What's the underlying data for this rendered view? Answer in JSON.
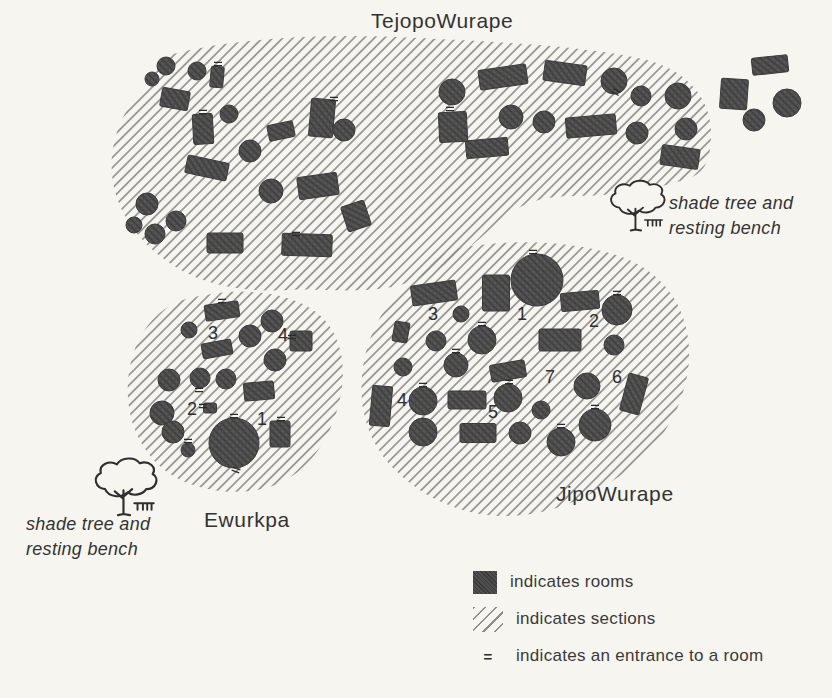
{
  "colors": {
    "paper": "#f6f5f0",
    "ink": "#333333",
    "room_fill": "#4f4f4f",
    "hatch_line": "#8d8d8d"
  },
  "legend": {
    "rooms_label": "indicates rooms",
    "sections_label": "indicates sections",
    "entrance_symbol": "=",
    "entrance_label": "indicates an entrance to a room"
  },
  "trees": [
    {
      "x": 606,
      "y": 182,
      "s": 0.95,
      "label": "shade tree and\nresting bench"
    },
    {
      "x": 90,
      "y": 460,
      "s": 1.08,
      "label": "shade tree and\nresting bench"
    }
  ],
  "diagram": {
    "compounds": [
      {
        "name": "TejopoWurape",
        "outline": "M173 54 C240 37 330 33 420 38 C495 42 575 45 638 58 C688 68 713 100 711 138 C710 162 704 172 690 178 C655 190 610 196 575 196 C548 196 530 200 512 212 C492 226 480 240 463 252 C445 266 420 281 392 287 C355 294 320 288 290 290 C258 292 222 289 193 276 C152 258 120 222 113 183 C107 146 121 112 142 90 C153 77 160 60 173 54 Z",
        "rooms": [
          {
            "t": "c",
            "x": 166,
            "y": 66,
            "r": 9
          },
          {
            "t": "c",
            "x": 152,
            "y": 79,
            "r": 7
          },
          {
            "t": "c",
            "x": 197,
            "y": 71,
            "r": 9
          },
          {
            "t": "r",
            "x": 217,
            "y": 77,
            "w": 13,
            "h": 21,
            "a": 5
          },
          {
            "t": "r",
            "x": 175,
            "y": 99,
            "w": 28,
            "h": 19,
            "a": 10
          },
          {
            "t": "r",
            "x": 203,
            "y": 129,
            "w": 20,
            "h": 30,
            "a": -3
          },
          {
            "t": "c",
            "x": 229,
            "y": 114,
            "r": 9
          },
          {
            "t": "r",
            "x": 281,
            "y": 131,
            "w": 26,
            "h": 16,
            "a": -12
          },
          {
            "t": "r",
            "x": 322,
            "y": 118,
            "w": 24,
            "h": 38,
            "a": 5
          },
          {
            "t": "c",
            "x": 344,
            "y": 130,
            "r": 11
          },
          {
            "t": "r",
            "x": 207,
            "y": 168,
            "w": 42,
            "h": 18,
            "a": 12
          },
          {
            "t": "c",
            "x": 250,
            "y": 151,
            "r": 11
          },
          {
            "t": "r",
            "x": 318,
            "y": 186,
            "w": 40,
            "h": 22,
            "a": -8
          },
          {
            "t": "c",
            "x": 271,
            "y": 191,
            "r": 12
          },
          {
            "t": "r",
            "x": 356,
            "y": 216,
            "w": 24,
            "h": 26,
            "a": -18
          },
          {
            "t": "c",
            "x": 147,
            "y": 204,
            "r": 11
          },
          {
            "t": "c",
            "x": 176,
            "y": 221,
            "r": 10
          },
          {
            "t": "c",
            "x": 155,
            "y": 234,
            "r": 10
          },
          {
            "t": "c",
            "x": 134,
            "y": 225,
            "r": 8
          },
          {
            "t": "r",
            "x": 225,
            "y": 243,
            "w": 36,
            "h": 20,
            "a": 0
          },
          {
            "t": "r",
            "x": 307,
            "y": 245,
            "w": 50,
            "h": 22,
            "a": 2
          },
          {
            "t": "c",
            "x": 452,
            "y": 92,
            "r": 13
          },
          {
            "t": "r",
            "x": 503,
            "y": 77,
            "w": 48,
            "h": 20,
            "a": -8
          },
          {
            "t": "r",
            "x": 565,
            "y": 73,
            "w": 42,
            "h": 20,
            "a": 8
          },
          {
            "t": "c",
            "x": 614,
            "y": 81,
            "r": 13
          },
          {
            "t": "c",
            "x": 641,
            "y": 96,
            "r": 10
          },
          {
            "t": "c",
            "x": 678,
            "y": 96,
            "r": 13
          },
          {
            "t": "r",
            "x": 453,
            "y": 127,
            "w": 28,
            "h": 30,
            "a": -3
          },
          {
            "t": "c",
            "x": 511,
            "y": 117,
            "r": 12
          },
          {
            "t": "c",
            "x": 544,
            "y": 122,
            "r": 11
          },
          {
            "t": "r",
            "x": 591,
            "y": 126,
            "w": 50,
            "h": 20,
            "a": -5
          },
          {
            "t": "c",
            "x": 637,
            "y": 133,
            "r": 11
          },
          {
            "t": "c",
            "x": 686,
            "y": 129,
            "r": 11
          },
          {
            "t": "r",
            "x": 487,
            "y": 148,
            "w": 42,
            "h": 18,
            "a": -5
          },
          {
            "t": "r",
            "x": 680,
            "y": 157,
            "w": 38,
            "h": 20,
            "a": 8
          }
        ],
        "entrances": [
          {
            "x": 218,
            "y": 64,
            "a": 0
          },
          {
            "x": 203,
            "y": 112,
            "a": 0
          },
          {
            "x": 296,
            "y": 234,
            "a": 0
          },
          {
            "x": 450,
            "y": 109,
            "a": 0
          },
          {
            "x": 616,
            "y": 92,
            "a": 30
          },
          {
            "x": 334,
            "y": 99,
            "a": 0
          }
        ],
        "numbers": []
      },
      {
        "name": "Ewurkpa",
        "outline": "M212 294 C252 287 300 295 323 318 C343 338 347 372 339 403 C331 436 312 468 280 483 C250 497 205 494 175 477 C148 461 130 432 128 398 C126 362 138 328 165 309 C180 298 195 297 212 294 Z",
        "rooms": [
          {
            "t": "r",
            "x": 222,
            "y": 311,
            "w": 34,
            "h": 16,
            "a": -8
          },
          {
            "t": "c",
            "x": 189,
            "y": 330,
            "r": 8
          },
          {
            "t": "c",
            "x": 250,
            "y": 336,
            "r": 11
          },
          {
            "t": "c",
            "x": 272,
            "y": 321,
            "r": 11
          },
          {
            "t": "r",
            "x": 301,
            "y": 341,
            "w": 22,
            "h": 20,
            "a": 0
          },
          {
            "t": "c",
            "x": 275,
            "y": 360,
            "r": 11
          },
          {
            "t": "r",
            "x": 217,
            "y": 349,
            "w": 30,
            "h": 15,
            "a": -10
          },
          {
            "t": "c",
            "x": 169,
            "y": 380,
            "r": 11
          },
          {
            "t": "c",
            "x": 200,
            "y": 378,
            "r": 10
          },
          {
            "t": "c",
            "x": 226,
            "y": 379,
            "r": 10
          },
          {
            "t": "r",
            "x": 259,
            "y": 391,
            "w": 30,
            "h": 18,
            "a": -5
          },
          {
            "t": "c",
            "x": 162,
            "y": 413,
            "r": 12
          },
          {
            "t": "r",
            "x": 210,
            "y": 408,
            "w": 13,
            "h": 10,
            "a": 0
          },
          {
            "t": "c",
            "x": 173,
            "y": 432,
            "r": 11
          },
          {
            "t": "c",
            "x": 188,
            "y": 450,
            "r": 7
          },
          {
            "t": "c",
            "x": 234,
            "y": 443,
            "r": 25
          },
          {
            "t": "r",
            "x": 280,
            "y": 434,
            "w": 20,
            "h": 26,
            "a": 0
          }
        ],
        "entrances": [
          {
            "x": 222,
            "y": 301,
            "a": 0
          },
          {
            "x": 203,
            "y": 406,
            "a": 0
          },
          {
            "x": 234,
            "y": 416,
            "a": 0
          },
          {
            "x": 236,
            "y": 470,
            "a": 20
          },
          {
            "x": 281,
            "y": 419,
            "a": 0
          },
          {
            "x": 199,
            "y": 390,
            "a": 0
          },
          {
            "x": 292,
            "y": 337,
            "a": 0
          },
          {
            "x": 188,
            "y": 441,
            "a": 0
          }
        ],
        "numbers": [
          {
            "n": "3",
            "x": 213,
            "y": 334
          },
          {
            "n": "4",
            "x": 283,
            "y": 336
          },
          {
            "n": "2",
            "x": 192,
            "y": 410
          },
          {
            "n": "1",
            "x": 262,
            "y": 420
          }
        ]
      },
      {
        "name": "JipoWurape",
        "outline": "M455 249 C510 238 575 240 622 257 C662 272 687 305 689 348 C691 388 672 432 638 462 C605 490 560 514 512 516 C466 518 424 499 395 470 C368 443 357 407 363 367 C369 325 395 288 425 268 C435 261 444 252 455 249 Z",
        "rooms": [
          {
            "t": "r",
            "x": 434,
            "y": 293,
            "w": 45,
            "h": 20,
            "a": -8
          },
          {
            "t": "c",
            "x": 461,
            "y": 314,
            "r": 8
          },
          {
            "t": "r",
            "x": 496,
            "y": 293,
            "w": 27,
            "h": 36,
            "a": 0
          },
          {
            "t": "c",
            "x": 537,
            "y": 280,
            "r": 26
          },
          {
            "t": "r",
            "x": 580,
            "y": 301,
            "w": 38,
            "h": 18,
            "a": -5
          },
          {
            "t": "c",
            "x": 617,
            "y": 310,
            "r": 15
          },
          {
            "t": "r",
            "x": 401,
            "y": 332,
            "w": 15,
            "h": 20,
            "a": 10
          },
          {
            "t": "c",
            "x": 436,
            "y": 341,
            "r": 10
          },
          {
            "t": "c",
            "x": 482,
            "y": 340,
            "r": 14
          },
          {
            "t": "r",
            "x": 560,
            "y": 340,
            "w": 42,
            "h": 22,
            "a": 0
          },
          {
            "t": "c",
            "x": 614,
            "y": 345,
            "r": 10
          },
          {
            "t": "c",
            "x": 456,
            "y": 365,
            "r": 12
          },
          {
            "t": "c",
            "x": 403,
            "y": 367,
            "r": 9
          },
          {
            "t": "r",
            "x": 508,
            "y": 371,
            "w": 35,
            "h": 17,
            "a": -10
          },
          {
            "t": "c",
            "x": 587,
            "y": 386,
            "r": 13
          },
          {
            "t": "r",
            "x": 634,
            "y": 394,
            "w": 20,
            "h": 38,
            "a": 15
          },
          {
            "t": "r",
            "x": 381,
            "y": 406,
            "w": 20,
            "h": 40,
            "a": 5
          },
          {
            "t": "c",
            "x": 423,
            "y": 401,
            "r": 14
          },
          {
            "t": "r",
            "x": 467,
            "y": 400,
            "w": 38,
            "h": 18,
            "a": 0
          },
          {
            "t": "c",
            "x": 508,
            "y": 398,
            "r": 14
          },
          {
            "t": "c",
            "x": 541,
            "y": 410,
            "r": 9
          },
          {
            "t": "c",
            "x": 423,
            "y": 432,
            "r": 14
          },
          {
            "t": "r",
            "x": 478,
            "y": 433,
            "w": 36,
            "h": 19,
            "a": 0
          },
          {
            "t": "c",
            "x": 520,
            "y": 433,
            "r": 11
          },
          {
            "t": "c",
            "x": 561,
            "y": 442,
            "r": 14
          },
          {
            "t": "c",
            "x": 595,
            "y": 425,
            "r": 16
          }
        ],
        "entrances": [
          {
            "x": 533,
            "y": 252,
            "a": 0
          },
          {
            "x": 617,
            "y": 293,
            "a": 0
          },
          {
            "x": 482,
            "y": 324,
            "a": 0
          },
          {
            "x": 456,
            "y": 351,
            "a": 0
          },
          {
            "x": 423,
            "y": 385,
            "a": 0
          },
          {
            "x": 509,
            "y": 382,
            "a": 0
          },
          {
            "x": 595,
            "y": 407,
            "a": 0
          },
          {
            "x": 561,
            "y": 426,
            "a": 0
          }
        ],
        "numbers": [
          {
            "n": "3",
            "x": 433,
            "y": 315
          },
          {
            "n": "1",
            "x": 522,
            "y": 315
          },
          {
            "n": "2",
            "x": 594,
            "y": 322
          },
          {
            "n": "7",
            "x": 550,
            "y": 378
          },
          {
            "n": "6",
            "x": 617,
            "y": 378
          },
          {
            "n": "4",
            "x": 402,
            "y": 401
          },
          {
            "n": "5",
            "x": 493,
            "y": 413
          }
        ]
      }
    ],
    "outside_rooms": [
      {
        "t": "r",
        "x": 770,
        "y": 65,
        "w": 36,
        "h": 17,
        "a": -6
      },
      {
        "t": "r",
        "x": 734,
        "y": 94,
        "w": 27,
        "h": 30,
        "a": 4
      },
      {
        "t": "c",
        "x": 754,
        "y": 120,
        "r": 11
      },
      {
        "t": "c",
        "x": 787,
        "y": 103,
        "r": 14
      }
    ]
  }
}
